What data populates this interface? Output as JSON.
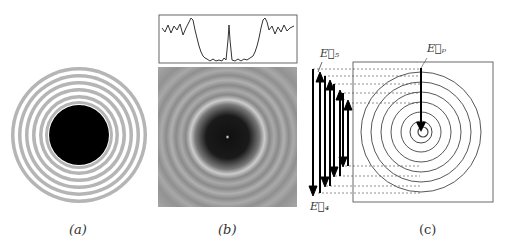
{
  "panels": {
    "a": {
      "caption": "(a)"
    },
    "b": {
      "caption": "(b)"
    },
    "c": {
      "caption": "(c)",
      "labels": {
        "e5": "E⃗₅",
        "e4": "E⃗₄",
        "ep": "E⃗ₚ"
      }
    }
  },
  "colors": {
    "ring_gray": "#b3b3b3",
    "core": "#000000",
    "line": "#333333"
  }
}
